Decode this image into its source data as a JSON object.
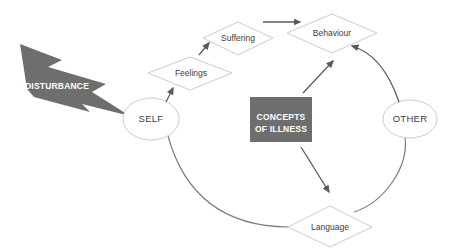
{
  "diagram": {
    "type": "concept-cycle-diagram",
    "background": "#ffffff",
    "colors": {
      "solid_shape": "#6e6e6e",
      "shape_outline": "#cccccc",
      "arrow": "#5a5a5a",
      "curve": "#7d7d7d",
      "label_text": "#3c3c3c",
      "inverse_text": "#ffffff"
    },
    "nodes": {
      "disturbance": {
        "label": "DISTURBANCE",
        "shape": "lightning-bolt"
      },
      "self": {
        "label": "SELF",
        "shape": "ellipse"
      },
      "feelings": {
        "label": "Feelings",
        "shape": "diamond"
      },
      "suffering": {
        "label": "Suffering",
        "shape": "diamond"
      },
      "behaviour": {
        "label": "Behaviour",
        "shape": "diamond"
      },
      "concepts_of_illness": {
        "label_line1": "CONCEPTS",
        "label_line2": "OF ILLNESS",
        "shape": "rectangle"
      },
      "other": {
        "label": "OTHER",
        "shape": "ellipse"
      },
      "language": {
        "label": "Language",
        "shape": "diamond"
      }
    },
    "edges": [
      {
        "from": "disturbance",
        "to": "self",
        "type": "solid-impact-shape"
      },
      {
        "from": "self",
        "to": "feelings",
        "type": "arrow"
      },
      {
        "from": "feelings",
        "to": "suffering",
        "type": "arrow"
      },
      {
        "from": "suffering",
        "to": "behaviour",
        "type": "arrow"
      },
      {
        "from": "concepts_of_illness",
        "to": "behaviour",
        "type": "arrow"
      },
      {
        "from": "concepts_of_illness",
        "to": "language",
        "type": "arrow"
      },
      {
        "from": "other",
        "to": "behaviour",
        "type": "curved-arrow"
      },
      {
        "from": "self",
        "to": "language",
        "type": "curve"
      },
      {
        "from": "other",
        "to": "language",
        "type": "curve"
      }
    ]
  }
}
